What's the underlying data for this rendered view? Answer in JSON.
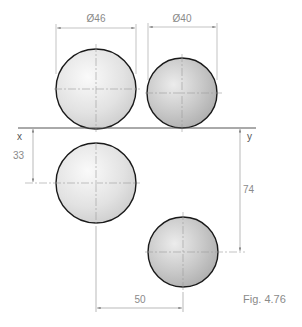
{
  "figure": {
    "caption": "Fig. 4.76",
    "xy_line": {
      "x_label": "x",
      "y_label": "y"
    },
    "dimensions": {
      "diameter_large": "Ø46",
      "diameter_small": "Ø40",
      "height_left": "33",
      "height_right": "74",
      "horizontal_distance": "50"
    },
    "spheres": [
      {
        "name": "large-sphere-elevation",
        "diameter": "Ø46"
      },
      {
        "name": "small-sphere-elevation",
        "diameter": "Ø40"
      },
      {
        "name": "large-sphere-plan"
      },
      {
        "name": "small-sphere-plan"
      }
    ],
    "colors": {
      "outline": "#1a1a1a",
      "dimension": "#8a8a8a",
      "centerline": "#9a9a9a"
    }
  }
}
